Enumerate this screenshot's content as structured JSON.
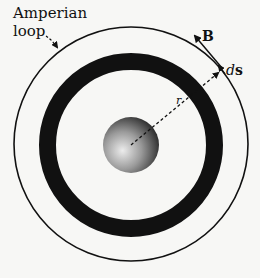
{
  "diagram": {
    "labels": {
      "amperian_line1": "Amperian",
      "amperian_line2": "loop",
      "field": "B",
      "element_d": "d",
      "element_s": "s",
      "radius": "r"
    },
    "colors": {
      "background": "#f7f7f5",
      "ink": "#111111",
      "sphere_light": "#e8e8e8",
      "sphere_dark": "#1a1a1a"
    },
    "geometry": {
      "center": [
        131,
        145
      ],
      "amperian_radius": 117,
      "ring_outer_radius": 92,
      "ring_inner_radius": 75,
      "sphere_radius": 28
    }
  }
}
